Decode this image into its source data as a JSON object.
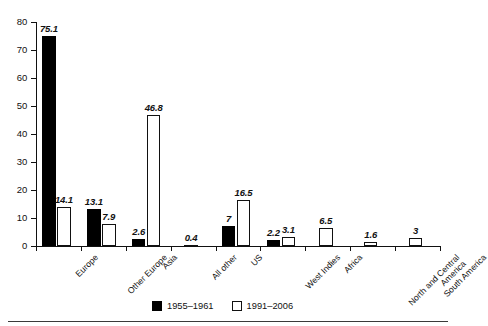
{
  "chart_data": {
    "type": "bar",
    "title": "",
    "subtitle": "",
    "xlabel": "",
    "ylabel": "",
    "ylim": [
      0,
      80
    ],
    "yticks": [
      0,
      10,
      20,
      30,
      40,
      50,
      60,
      70,
      80
    ],
    "ytick_labels": [
      "0",
      "10",
      "20",
      "30",
      "40",
      "50",
      "60",
      "70",
      "80"
    ],
    "grid": false,
    "legend_position": "bottom-center",
    "categories": [
      "Europe",
      "Other Europe",
      "Asia",
      "All other",
      "US",
      "West Indies",
      "Africa",
      "North and Central America",
      "South America"
    ],
    "series": [
      {
        "name": "1955–1961",
        "color": "#000000",
        "style": "filled",
        "values": [
          75.1,
          13.1,
          2.6,
          null,
          7,
          2.2,
          null,
          null,
          null
        ],
        "value_labels": [
          "75.1",
          "13.1",
          "2.6",
          "",
          "7",
          "2.2",
          "",
          "",
          ""
        ]
      },
      {
        "name": "1991–2006",
        "color": "#ffffff",
        "style": "outlined",
        "values": [
          14.1,
          7.9,
          46.8,
          0.4,
          16.5,
          3.1,
          6.5,
          1.6,
          3
        ],
        "value_labels": [
          "14.1",
          "7.9",
          "46.8",
          "0.4",
          "16.5",
          "3.1",
          "6.5",
          "1.6",
          "3"
        ]
      }
    ]
  },
  "legend": {
    "entries": [
      {
        "label": "1955–1961",
        "swatch": "filled-black-square"
      },
      {
        "label": "1991–2006",
        "swatch": "outlined-white-square"
      }
    ]
  },
  "colors": {
    "series_1955_1961": "#000000",
    "series_1991_2006": "#ffffff",
    "axis": "#111111",
    "background": "#ffffff"
  }
}
